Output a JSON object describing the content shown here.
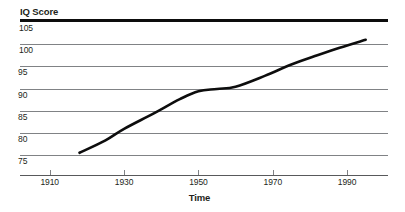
{
  "chart_data": {
    "type": "line",
    "title": "",
    "xlabel": "Time",
    "ylabel": "IQ Score",
    "xlim": [
      1902,
      2001
    ],
    "ylim": [
      72.4,
      105
    ],
    "grid": true,
    "legend": false,
    "x_ticks": [
      1910,
      1930,
      1950,
      1970,
      1990
    ],
    "x_tick_labels": [
      "1910",
      "1930",
      "1950",
      "1970",
      "1990"
    ],
    "y_ticks": [
      75,
      80,
      85,
      90,
      95,
      100,
      105
    ],
    "y_tick_labels": [
      "75",
      "80",
      "85",
      "90",
      "95",
      "100",
      "105"
    ],
    "series": [
      {
        "name": "IQ Score",
        "color": "#0d0d0d",
        "x": [
          1918,
          1925,
          1930,
          1938,
          1945,
          1950,
          1955,
          1960,
          1968,
          1975,
          1982,
          1988,
          1995
        ],
        "y": [
          75.5,
          78.3,
          80.9,
          84.4,
          87.6,
          89.4,
          89.9,
          90.4,
          92.9,
          95.4,
          97.5,
          99.2,
          101.0
        ]
      }
    ],
    "axis_colors": {
      "top_rule": "#0d0d0d",
      "gridline": "#808285",
      "x_axis": "#58595b",
      "text": "#231f20"
    }
  }
}
